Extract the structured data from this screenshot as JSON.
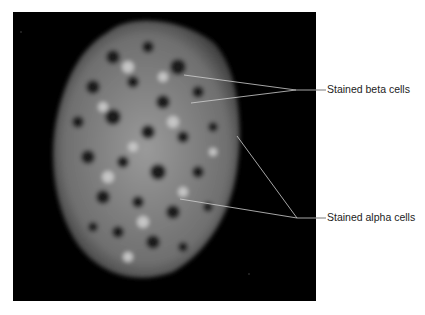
{
  "figure": {
    "image_description": "Fluorescence micrograph of a pancreatic islet with stained cells on black background",
    "labels": [
      {
        "text": "Stained beta cells"
      },
      {
        "text": "Stained alpha cells"
      }
    ],
    "colors": {
      "background": "#ffffff",
      "panel": "#000000",
      "leader_line": "#cfcfcf",
      "label_text": "#222222"
    }
  }
}
